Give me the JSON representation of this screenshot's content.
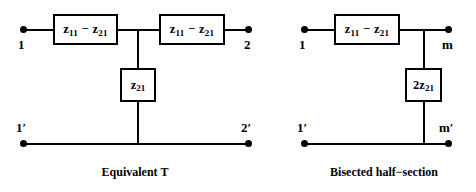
{
  "figure": {
    "background_color": "#ffffff",
    "stroke_color": "#000000",
    "circuits": [
      {
        "id": "equivalent-t",
        "caption": "Equivalent T",
        "series_elements": [
          {
            "id": "left-series-1",
            "label_html": "z<sub>11</sub> − z<sub>21</sub>",
            "label_text": "z11 - z21"
          },
          {
            "id": "left-series-2",
            "label_html": "z<sub>11</sub> − z<sub>21</sub>",
            "label_text": "z11 - z21"
          }
        ],
        "shunt_elements": [
          {
            "id": "left-shunt",
            "label_html": "z<sub>21</sub>",
            "label_text": "z21"
          }
        ],
        "terminals": [
          {
            "id": "left-in-top",
            "label": "1"
          },
          {
            "id": "left-out-top",
            "label": "2"
          },
          {
            "id": "left-in-bottom",
            "label": "1′"
          },
          {
            "id": "left-out-bottom",
            "label": "2′"
          }
        ]
      },
      {
        "id": "bisected-half-section",
        "caption": "Bisected half−section",
        "series_elements": [
          {
            "id": "right-series-1",
            "label_html": "z<sub>11</sub> − z<sub>21</sub>",
            "label_text": "z11 - z21"
          }
        ],
        "shunt_elements": [
          {
            "id": "right-shunt",
            "label_html": "2z<sub>21</sub>",
            "label_text": "2z21"
          }
        ],
        "terminals": [
          {
            "id": "right-in-top",
            "label": "1"
          },
          {
            "id": "right-out-top",
            "label": "m"
          },
          {
            "id": "right-in-bottom",
            "label": "1′"
          },
          {
            "id": "right-out-bottom",
            "label": "m′"
          }
        ]
      }
    ]
  }
}
